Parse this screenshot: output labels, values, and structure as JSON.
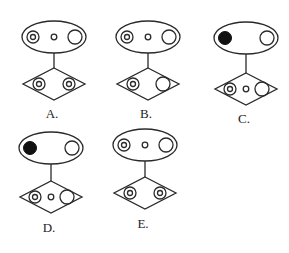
{
  "figures": [
    {
      "label": "A.",
      "ellipse_items": [
        "double-circle",
        "small-circle",
        "large-circle"
      ],
      "diamond_items": [
        "double-circle",
        "double-circle"
      ]
    },
    {
      "label": "B.",
      "ellipse_items": [
        "double-circle",
        "small-circle",
        "large-circle"
      ],
      "diamond_items": [
        "double-circle",
        "large-circle"
      ]
    },
    {
      "label": "C.",
      "ellipse_items": [
        "filled-circle",
        "large-circle"
      ],
      "diamond_items": [
        "double-circle",
        "small-circle",
        "large-circle"
      ]
    },
    {
      "label": "D.",
      "ellipse_items": [
        "filled-circle",
        "large-circle"
      ],
      "diamond_items": [
        "double-circle",
        "small-circle",
        "large-circle"
      ]
    },
    {
      "label": "E.",
      "ellipse_items": [
        "double-circle",
        "small-circle",
        "large-circle"
      ],
      "diamond_items": [
        "double-circle",
        "double-circle"
      ]
    }
  ]
}
